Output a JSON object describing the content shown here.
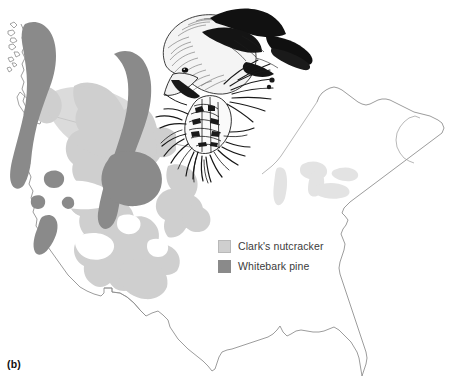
{
  "figure": {
    "panel_label": "(b)",
    "kind": "range-map",
    "region": "North America (United States and southern Canada)",
    "illustration": {
      "name": "clarks-nutcracker-illustration",
      "subject": "Clark's nutcracker feeding on a whitebark pine cone",
      "style": "pen-and-ink line drawing"
    }
  },
  "legend": {
    "position": "center-right",
    "items": [
      {
        "label": "Clark's nutcracker",
        "color": "#cfcfcf",
        "name": "clarks-nutcracker"
      },
      {
        "label": "Whitebark pine",
        "color": "#8a8a8a",
        "name": "whitebark-pine"
      }
    ]
  },
  "colors": {
    "nutcracker_range": "#cfcfcf",
    "pine_range": "#8a8a8a",
    "lakes": "#e2e2e2",
    "coastline": "#7d7d7d",
    "border": "#8d8d8d",
    "background": "#ffffff",
    "ink": "#1a1a1a"
  },
  "map_features": {
    "coastline_name": "north-america-coastline",
    "us_canada_border": "us-canada-border",
    "us_mexico_border": "us-mexico-border",
    "great_lakes": "great-lakes",
    "nutcracker_polygons": 7,
    "pine_polygons": 6
  }
}
